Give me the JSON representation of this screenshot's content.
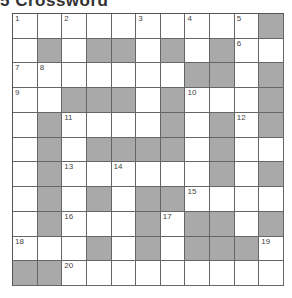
{
  "title": "5 Crossword",
  "grid": {
    "rows": 11,
    "cols": 11,
    "colors": {
      "block": "#a9a9a9",
      "cell": "#ffffff"
    },
    "layout": [
      "...........",
      ".#.##.#.#..",
      ".......##.#",
      "..###.#...#",
      ".#....#.#.#",
      ".#.####.#..",
      ".#......#.#",
      ".#.#.##....",
      ".#...#.##.#",
      "...#.#.###.",
      "##........."
    ],
    "blocks_fix": [
      [
        0,
        10
      ]
    ],
    "numbers": [
      {
        "r": 0,
        "c": 0,
        "n": "1"
      },
      {
        "r": 0,
        "c": 2,
        "n": "2"
      },
      {
        "r": 0,
        "c": 5,
        "n": "3"
      },
      {
        "r": 0,
        "c": 7,
        "n": "4"
      },
      {
        "r": 0,
        "c": 9,
        "n": "5"
      },
      {
        "r": 1,
        "c": 9,
        "n": "6"
      },
      {
        "r": 2,
        "c": 0,
        "n": "7"
      },
      {
        "r": 2,
        "c": 1,
        "n": "8"
      },
      {
        "r": 3,
        "c": 0,
        "n": "9"
      },
      {
        "r": 3,
        "c": 7,
        "n": "10"
      },
      {
        "r": 4,
        "c": 2,
        "n": "11"
      },
      {
        "r": 4,
        "c": 9,
        "n": "12"
      },
      {
        "r": 6,
        "c": 2,
        "n": "13"
      },
      {
        "r": 6,
        "c": 4,
        "n": "14"
      },
      {
        "r": 7,
        "c": 7,
        "n": "15"
      },
      {
        "r": 8,
        "c": 2,
        "n": "16"
      },
      {
        "r": 8,
        "c": 6,
        "n": "17"
      },
      {
        "r": 9,
        "c": 0,
        "n": "18"
      },
      {
        "r": 9,
        "c": 10,
        "n": "19"
      },
      {
        "r": 10,
        "c": 2,
        "n": "20"
      }
    ]
  }
}
